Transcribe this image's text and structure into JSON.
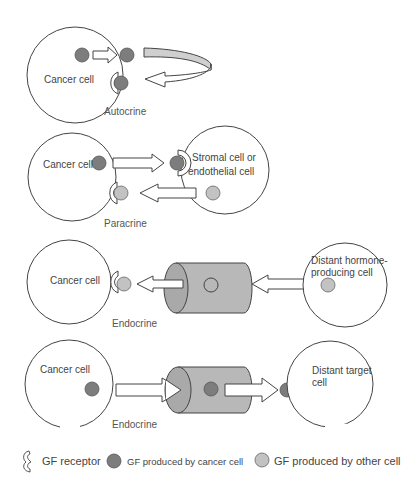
{
  "panels": {
    "autocrine": {
      "cell_label": "Cancer cell",
      "caption": "Autocrine"
    },
    "paracrine": {
      "cell_label": "Cancer cell",
      "other_cell_label_line1": "Stromal cell or",
      "other_cell_label_line2": "endothelial cell",
      "caption": "Paracrine"
    },
    "endocrine_in": {
      "cell_label": "Cancer cell",
      "source_cell_label_line1": "Distant hormone-",
      "source_cell_label_line2": "producing cell",
      "caption": "Endocrine"
    },
    "endocrine_out": {
      "cell_label": "Cancer cell",
      "target_cell_label_line1": "Distant target",
      "target_cell_label_line2": "cell",
      "caption": "Endocrine"
    }
  },
  "legend": {
    "receptor": "GF receptor",
    "cancer_gf": "GF produced by cancer cell",
    "other_gf": "GF produced by other cell"
  },
  "colors": {
    "gf_cancer": "#7d7d7d",
    "gf_other": "#c2c2c2",
    "vessel": "#b8b8b8",
    "outline": "#444444"
  }
}
